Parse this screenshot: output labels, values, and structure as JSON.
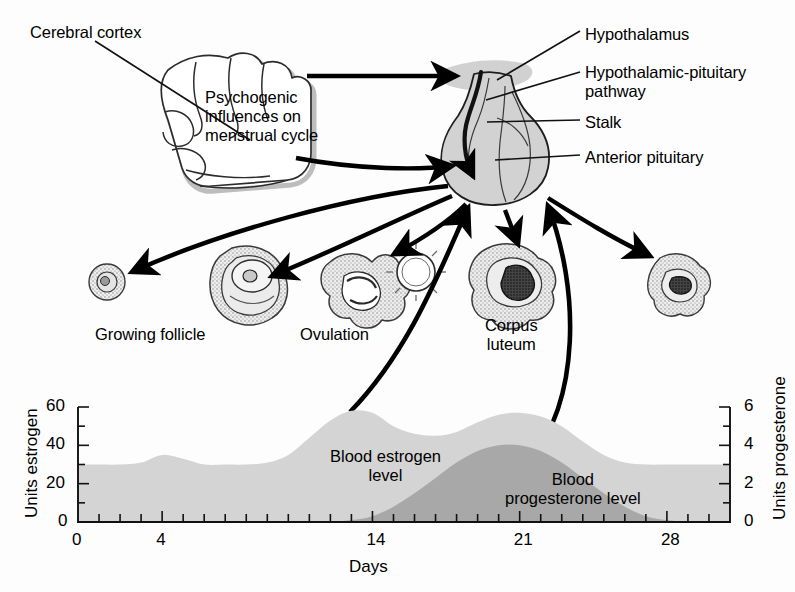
{
  "figure": {
    "title_visible": false,
    "background": "#fdfdfd",
    "ink": "#000000"
  },
  "anatomy": {
    "labels": [
      {
        "key": "cerebral_cortex",
        "text": "Cerebral cortex",
        "x": 30,
        "y": 23
      },
      {
        "key": "psychogenic",
        "text": "Psychogenic\ninfluences on\nmenstrual cycle",
        "x": 205,
        "y": 88
      },
      {
        "key": "hypothalamus",
        "text": "Hypothalamus",
        "x": 585,
        "y": 25
      },
      {
        "key": "hpp",
        "text": "Hypothalamic-pituitary\npathway",
        "x": 585,
        "y": 63
      },
      {
        "key": "stalk",
        "text": "Stalk",
        "x": 585,
        "y": 113
      },
      {
        "key": "anterior_pituitary",
        "text": "Anterior pituitary",
        "x": 585,
        "y": 148
      }
    ],
    "structures": [
      {
        "key": "growing_follicle",
        "label": "Growing follicle",
        "label_x": 95,
        "label_y": 325
      },
      {
        "key": "ovulation",
        "label": "Ovulation",
        "label_x": 300,
        "label_y": 325
      },
      {
        "key": "corpus_luteum",
        "label": "Corpus\nluteum",
        "label_x": 485,
        "label_y": 316
      },
      {
        "key": "corpus_albicans",
        "label": "",
        "label_x": 0,
        "label_y": 0
      }
    ],
    "colors": {
      "gland_fill": "#d2d2d2",
      "gland_stroke": "#1a1a1a",
      "cortex_fill": "#ffffff",
      "cortex_stroke": "#2a2a2a",
      "cortex_shadow": "#b9b9b9",
      "ovary_fill": "#e8e8e8",
      "ovary_stroke": "#3a3a3a",
      "ovary_dark": "#2b2b2b",
      "arrow": "#000000"
    }
  },
  "chart_data": {
    "type": "area",
    "title": "",
    "xlabel": "Days",
    "ylabel": "Units estrogen",
    "y2label": "Units progesterone",
    "xlim": [
      0,
      31
    ],
    "ylim": [
      0,
      60
    ],
    "y2lim": [
      0,
      6
    ],
    "xticks_major": [
      0,
      4,
      14,
      21,
      28
    ],
    "xtick_labels": [
      "0",
      "4",
      "14",
      "21",
      "28"
    ],
    "xticks_minor_step": 1,
    "yticks_major": [
      0,
      20,
      40,
      60
    ],
    "ytick_labels": [
      "0",
      "20",
      "40",
      "60"
    ],
    "yticks_minor": [
      10,
      30,
      50
    ],
    "y2ticks_major": [
      0,
      2,
      4,
      6
    ],
    "y2tick_labels": [
      "0",
      "2",
      "4",
      "6"
    ],
    "y2ticks_minor": [
      1,
      3,
      5
    ],
    "grid": false,
    "legend_position": "inline-annotation",
    "series": [
      {
        "name": "Blood estrogen level",
        "axis": "left",
        "fill": "#d4d4d4",
        "annotation": "Blood estrogen\nlevel",
        "annotation_x": 330,
        "annotation_y": 447,
        "x": [
          0,
          1,
          2,
          3,
          4,
          5,
          6,
          7,
          8,
          9,
          10,
          11,
          12,
          13,
          14,
          15,
          16,
          17,
          18,
          19,
          20,
          21,
          22,
          23,
          24,
          25,
          26,
          27,
          28,
          29,
          30,
          31
        ],
        "values": [
          30,
          30,
          30,
          31,
          35,
          33,
          30,
          30,
          30,
          31,
          35,
          44,
          53,
          58,
          57,
          50,
          46,
          45,
          47,
          52,
          56,
          57,
          55,
          50,
          42,
          35,
          31,
          30,
          30,
          30,
          30,
          30
        ]
      },
      {
        "name": "Blood progesterone level",
        "axis": "right",
        "fill": "#a8a8a8",
        "annotation": "Blood\nprogesterone level",
        "annotation_x": 505,
        "annotation_y": 470,
        "x": [
          0,
          1,
          2,
          3,
          4,
          5,
          6,
          7,
          8,
          9,
          10,
          11,
          12,
          13,
          14,
          15,
          16,
          17,
          18,
          19,
          20,
          21,
          22,
          23,
          24,
          25,
          26,
          27,
          28,
          29,
          30,
          31
        ],
        "values": [
          0,
          0,
          0,
          0,
          0,
          0,
          0,
          0,
          0,
          0,
          0,
          0,
          0,
          0.1,
          0.3,
          0.8,
          1.5,
          2.3,
          3.1,
          3.7,
          4.0,
          4.0,
          3.7,
          3.1,
          2.3,
          1.5,
          0.8,
          0.3,
          0.1,
          0,
          0,
          0
        ]
      }
    ],
    "plot_box": {
      "x0": 78,
      "y0": 407,
      "x1": 730,
      "y1": 522
    }
  }
}
